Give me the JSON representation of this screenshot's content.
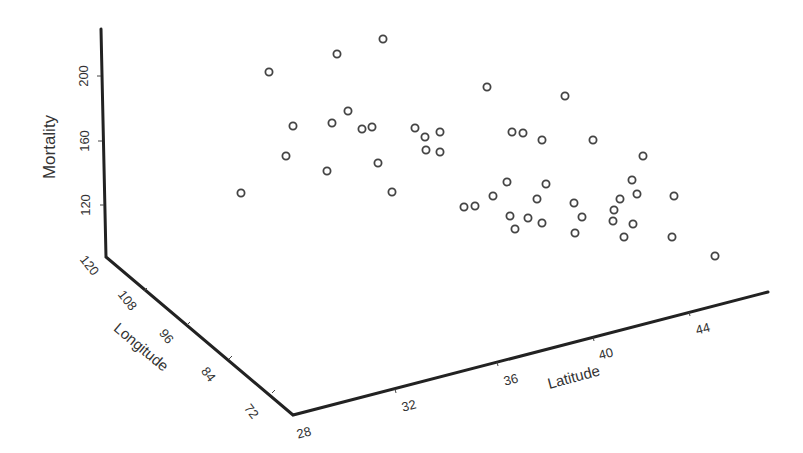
{
  "chart_data": {
    "type": "scatter",
    "projection": "3d",
    "title": "",
    "xlabel": "Latitude",
    "ylabel": "Longitude",
    "zlabel": "Mortality",
    "x_ticks": [
      28,
      32,
      36,
      40,
      44
    ],
    "y_ticks": [
      72,
      84,
      96,
      108,
      120
    ],
    "z_ticks": [
      120,
      160,
      200
    ],
    "xlim": [
      28,
      47
    ],
    "ylim": [
      72,
      120
    ],
    "zlim": [
      100,
      230
    ],
    "grid": false,
    "legend": null,
    "points_screen": [
      [
        383,
        39
      ],
      [
        337,
        54
      ],
      [
        269,
        72
      ],
      [
        348,
        111
      ],
      [
        293,
        126
      ],
      [
        332,
        123
      ],
      [
        362,
        129
      ],
      [
        372,
        127
      ],
      [
        415,
        128
      ],
      [
        286,
        156
      ],
      [
        378,
        163
      ],
      [
        327,
        171
      ],
      [
        241,
        193
      ],
      [
        392,
        192
      ],
      [
        487,
        87
      ],
      [
        565,
        96
      ],
      [
        425,
        137
      ],
      [
        440,
        132
      ],
      [
        426,
        150
      ],
      [
        440,
        152
      ],
      [
        512,
        132
      ],
      [
        523,
        133
      ],
      [
        542,
        140
      ],
      [
        593,
        140
      ],
      [
        507,
        182
      ],
      [
        546,
        184
      ],
      [
        493,
        196
      ],
      [
        537,
        199
      ],
      [
        464,
        207
      ],
      [
        475,
        206
      ],
      [
        574,
        203
      ],
      [
        510,
        216
      ],
      [
        528,
        218
      ],
      [
        542,
        223
      ],
      [
        582,
        217
      ],
      [
        515,
        229
      ],
      [
        575,
        233
      ],
      [
        643,
        156
      ],
      [
        632,
        180
      ],
      [
        637,
        194
      ],
      [
        620,
        199
      ],
      [
        674,
        196
      ],
      [
        614,
        210
      ],
      [
        613,
        221
      ],
      [
        633,
        224
      ],
      [
        624,
        237
      ],
      [
        672,
        237
      ],
      [
        715,
        256
      ]
    ],
    "note": "49-state style dataset; screen coords are projected positions of each marker"
  },
  "axes": {
    "z_axis": {
      "title": "Mortality",
      "ticks": [
        {
          "label": "200",
          "x": 101,
          "y": 76
        },
        {
          "label": "160",
          "x": 102,
          "y": 141
        },
        {
          "label": "120",
          "x": 104,
          "y": 205
        }
      ]
    },
    "y_axis": {
      "title": "Longitude",
      "ticks": [
        {
          "label": "120",
          "x": 106,
          "y": 257
        },
        {
          "label": "108",
          "x": 147,
          "y": 288
        },
        {
          "label": "96",
          "x": 190,
          "y": 322
        },
        {
          "label": "84",
          "x": 232,
          "y": 356
        },
        {
          "label": "72",
          "x": 275,
          "y": 393
        }
      ]
    },
    "x_axis": {
      "title": "Latitude",
      "ticks": [
        {
          "label": "28",
          "x": 293,
          "y": 415
        },
        {
          "label": "32",
          "x": 395,
          "y": 389
        },
        {
          "label": "36",
          "x": 497,
          "y": 362
        },
        {
          "label": "40",
          "x": 593,
          "y": 337
        },
        {
          "label": "44",
          "x": 689,
          "y": 312
        }
      ]
    }
  }
}
